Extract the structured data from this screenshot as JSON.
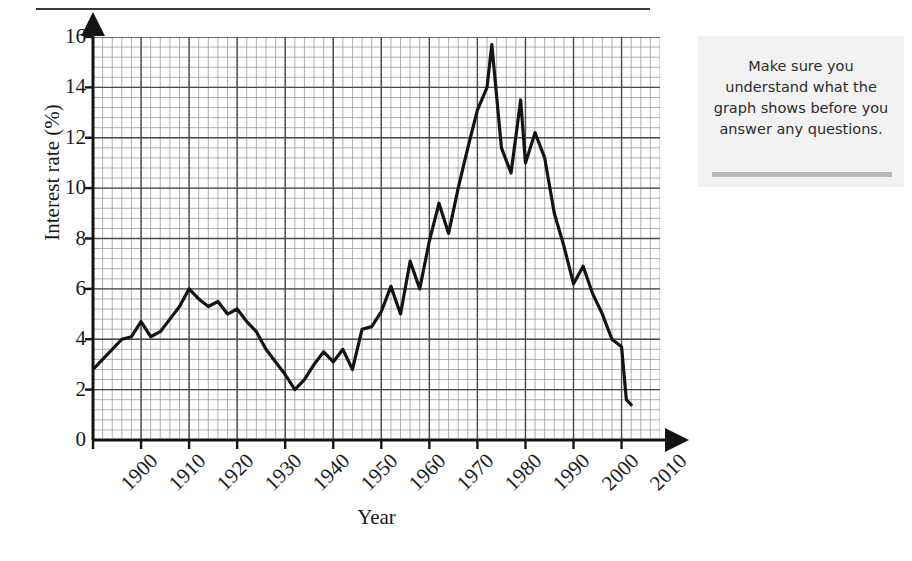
{
  "page": {
    "title_fragment": "",
    "background": "#ffffff"
  },
  "note": {
    "text": "Make sure you understand what the graph shows before you answer any questions.",
    "background": "#f2f2f2",
    "bar_color": "#b9b9b9"
  },
  "axis": {
    "ylabel": "Interest rate (%)",
    "xlabel": "Year"
  },
  "chart_data": {
    "type": "line",
    "title": "",
    "xlabel": "Year",
    "ylabel": "Interest rate (%)",
    "xlim": [
      1900,
      2018
    ],
    "ylim": [
      0,
      16
    ],
    "yticks": [
      0,
      2,
      4,
      6,
      8,
      10,
      12,
      14,
      16
    ],
    "xticks": [
      1900,
      1910,
      1920,
      1930,
      1940,
      1950,
      1960,
      1970,
      1980,
      1990,
      2000,
      2010
    ],
    "xtick_labels": [
      "1900",
      "1910",
      "1920",
      "1930",
      "1940",
      "1950",
      "1960",
      "1970",
      "1980",
      "1990",
      "2000",
      "2010"
    ],
    "ytick_labels": [
      "0",
      "2",
      "4",
      "6",
      "8",
      "10",
      "12",
      "14",
      "16"
    ],
    "grid": true,
    "grid_major_step_x": 10,
    "grid_major_step_y": 2,
    "grid_minor_divisions": 5,
    "legend": null,
    "line_color": "#141414",
    "line_width": 3.2,
    "series": [
      {
        "name": "Interest rate",
        "x": [
          1900,
          1903,
          1906,
          1908,
          1910,
          1912,
          1914,
          1916,
          1918,
          1920,
          1922,
          1924,
          1926,
          1928,
          1930,
          1932,
          1934,
          1936,
          1938,
          1940,
          1942,
          1944,
          1946,
          1948,
          1950,
          1952,
          1954,
          1956,
          1958,
          1960,
          1962,
          1964,
          1966,
          1968,
          1970,
          1972,
          1974,
          1976,
          1978,
          1980,
          1982,
          1983,
          1985,
          1987,
          1989,
          1990,
          1992,
          1994,
          1996,
          1998,
          2000,
          2002,
          2004,
          2006,
          2008,
          2010,
          2011,
          2012
        ],
        "y": [
          2.8,
          3.4,
          4.0,
          4.1,
          4.7,
          4.1,
          4.3,
          4.8,
          5.3,
          6.0,
          5.6,
          5.3,
          5.5,
          5.0,
          5.2,
          4.7,
          4.3,
          3.6,
          3.1,
          2.6,
          2.0,
          2.4,
          3.0,
          3.5,
          3.1,
          3.6,
          2.8,
          4.4,
          4.5,
          5.1,
          6.1,
          5.0,
          7.1,
          6.0,
          7.9,
          9.4,
          8.2,
          10.0,
          11.6,
          13.1,
          14.0,
          15.7,
          11.6,
          10.6,
          13.5,
          11.0,
          12.2,
          11.2,
          9.0,
          7.7,
          6.2,
          6.9,
          5.8,
          5.0,
          4.0,
          3.7,
          1.6,
          1.4
        ],
        "notable_points": [
          {
            "year": 1900,
            "value": 2.8,
            "label": "start"
          },
          {
            "year": 1920,
            "value": 6.0,
            "label": "early peak"
          },
          {
            "year": 1942,
            "value": 2.0,
            "label": "wartime low"
          },
          {
            "year": 1983,
            "value": 15.7,
            "label": "maximum"
          },
          {
            "year": 1989,
            "value": 13.5,
            "label": "secondary peak"
          },
          {
            "year": 2012,
            "value": 1.4,
            "label": "end"
          }
        ]
      }
    ]
  }
}
